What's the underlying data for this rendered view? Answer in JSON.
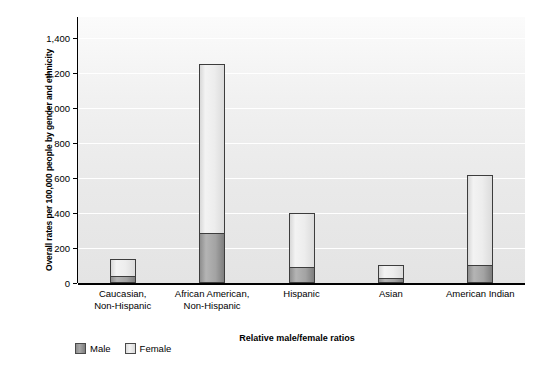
{
  "chart_data": {
    "type": "bar",
    "stacked": true,
    "title": "",
    "xlabel": "Relative male/female ratios",
    "ylabel": "Overall rates per 100,000 people by gender and ethnicity",
    "categories": [
      "Caucasian, Non-Hispanic",
      "African American, Non-Hispanic",
      "Hispanic",
      "Asian",
      "American Indian"
    ],
    "category_lines": [
      [
        "Caucasian,",
        "Non-Hispanic"
      ],
      [
        "African American,",
        "Non-Hispanic"
      ],
      [
        "Hispanic"
      ],
      [
        "Asian"
      ],
      [
        "American Indian"
      ]
    ],
    "series": [
      {
        "name": "Male",
        "color": "#999999",
        "values": [
          38,
          287,
          90,
          30,
          105
        ]
      },
      {
        "name": "Female",
        "color": "#e8e8e8",
        "values": [
          102,
          963,
          310,
          75,
          515
        ]
      }
    ],
    "totals": [
      140,
      1250,
      400,
      105,
      620
    ],
    "ylim": [
      0,
      1520
    ],
    "yticks": [
      0,
      200,
      400,
      600,
      800,
      1000,
      1200,
      1400
    ],
    "ytick_labels": [
      "0",
      "200",
      "400",
      "600",
      "800",
      "1,000",
      "1,200",
      "1,400"
    ],
    "grid": true,
    "grid_axis": "y",
    "legend_position": "bottom-left",
    "legend": [
      "Male",
      "Female"
    ],
    "plot_background": "#ededed"
  },
  "axis": {
    "y_title": "Overall rates per 100,000 people by gender and ethnicity",
    "x_title": "Relative male/female ratios"
  },
  "legend": {
    "male_label": "Male",
    "female_label": "Female"
  }
}
